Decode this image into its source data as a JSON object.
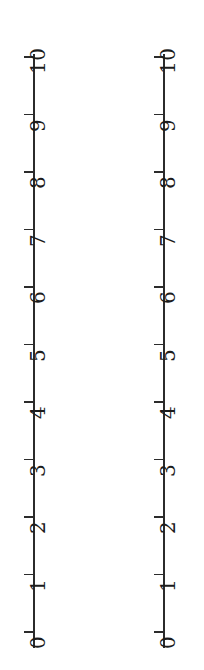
{
  "figure": {
    "background_color": "#ffffff",
    "stroke_color": "#2b2b2b",
    "text_color": "#1c1c1c",
    "orientation": "vertical",
    "label_rotation_degrees": -90
  },
  "chart_data": {
    "type": "scatter",
    "title": "",
    "subtitle": "",
    "xlabel": "",
    "ylabel": "",
    "grid": false,
    "legend": null,
    "annotations": [],
    "series": [],
    "axes": [
      {
        "name": "left-number-line",
        "position": "left",
        "scale": "linear",
        "range": [
          0,
          10
        ],
        "tick_step": 1,
        "tick_values": [
          0,
          1,
          2,
          3,
          4,
          5,
          6,
          7,
          8,
          9,
          10
        ],
        "tick_labels": [
          "0",
          "1",
          "2",
          "3",
          "4",
          "5",
          "6",
          "7",
          "8",
          "9",
          "10"
        ],
        "tick_side": "left",
        "label_side": "right"
      },
      {
        "name": "right-number-line",
        "position": "right",
        "scale": "linear",
        "range": [
          0,
          10
        ],
        "tick_step": 1,
        "tick_values": [
          0,
          1,
          2,
          3,
          4,
          5,
          6,
          7,
          8,
          9,
          10
        ],
        "tick_labels": [
          "0",
          "1",
          "2",
          "3",
          "4",
          "5",
          "6",
          "7",
          "8",
          "9",
          "10"
        ],
        "tick_side": "left",
        "label_side": "right"
      }
    ]
  },
  "layout": {
    "tick_top_y": 57,
    "tick_spacing_px": 57.5,
    "axis_line_top_y": 54,
    "axis_line_height_px": 594
  }
}
